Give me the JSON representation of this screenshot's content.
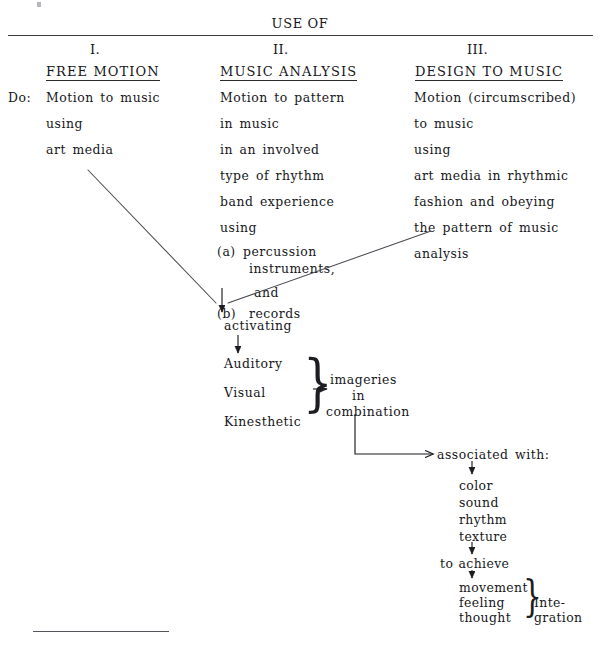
{
  "document": {
    "header_title": "USE OF",
    "columns": [
      {
        "numeral": "I.",
        "title": "FREE MOTION",
        "prefix_label": "Do:",
        "lines": [
          "Motion to music",
          "using",
          "art media"
        ]
      },
      {
        "numeral": "II.",
        "title": "MUSIC ANALYSIS",
        "lines": [
          "Motion to pattern",
          "in music",
          "in an involved",
          "type of rhythm",
          "band experience",
          "using"
        ],
        "sub_items": [
          {
            "marker": "(a)",
            "text": "percussion",
            "continuation": "instruments,"
          },
          {
            "conjunction": "and"
          },
          {
            "marker": "(b)",
            "text": "records"
          }
        ]
      },
      {
        "numeral": "III.",
        "title": "DESIGN TO MUSIC",
        "lines": [
          "Motion (circumscribed)",
          "to music",
          "using",
          "art media in rhythmic",
          "fashion and obeying",
          "the pattern of music",
          "analysis"
        ]
      }
    ],
    "flow": {
      "activating": "activating",
      "modalities": [
        "Auditory",
        "Visual",
        "Kinesthetic"
      ],
      "imageries": [
        "imageries",
        "in",
        "combination"
      ],
      "associated_with": "associated with:",
      "qualities": [
        "color",
        "sound",
        "rhythm",
        "texture"
      ],
      "to_achieve": "to achieve",
      "outcomes": [
        "movement",
        "feeling",
        "thought"
      ],
      "integration": [
        "Inte-",
        "gration"
      ]
    }
  },
  "style": {
    "ink": "#16161a",
    "rule": "#3b3b40",
    "paper": "#ffffff"
  }
}
